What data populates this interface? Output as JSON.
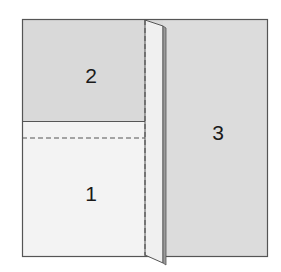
{
  "diagram": {
    "type": "paper-folding",
    "panels": [
      {
        "id": "panel-1",
        "label": "1",
        "fill": "#f3f3f3",
        "x": 91,
        "y": 193
      },
      {
        "id": "panel-2",
        "label": "2",
        "fill": "#d9d9d9",
        "x": 91,
        "y": 75
      },
      {
        "id": "panel-3",
        "label": "3",
        "fill": "#dcdcdc",
        "x": 218,
        "y": 132
      }
    ],
    "colors": {
      "outline": "#555555",
      "dashed": "#555555",
      "flap": "#f0f0f0",
      "text": "#1a1a1a"
    }
  }
}
